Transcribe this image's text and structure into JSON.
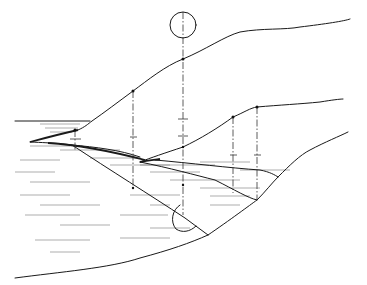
{
  "figure": {
    "colors": {
      "line": "#1a1a1a",
      "hatch": "#777777",
      "background": "#ffffff"
    },
    "elements": {
      "top_circle": {
        "cx": 183,
        "cy": 25,
        "r": 13
      },
      "bottom_semicircle": {
        "cx": 183,
        "cy": 217,
        "r": 12
      },
      "center_axis_x": 183,
      "reference_lines_x": [
        75,
        133,
        183,
        233,
        257
      ]
    }
  }
}
